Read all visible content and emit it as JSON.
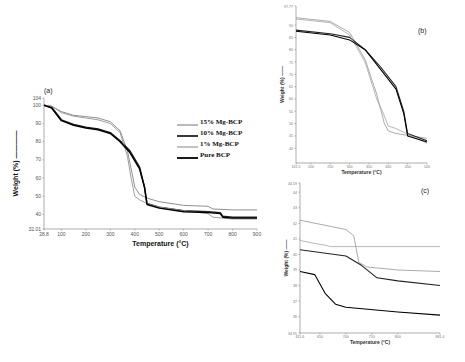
{
  "figure": {
    "panels": [
      "(a)",
      "(b)",
      "(c)"
    ]
  },
  "legend": {
    "items": [
      {
        "label": "15% Mg-BCP",
        "color": "#8a8a8a",
        "width": 1.2
      },
      {
        "label": "10% Mg-BCP",
        "color": "#222222",
        "width": 1.8
      },
      {
        "label": "1% Mg-BCP",
        "color": "#9a9a9a",
        "width": 1.2
      },
      {
        "label": "Pure BCP",
        "color": "#000000",
        "width": 1.8
      }
    ]
  },
  "chart_data": [
    {
      "type": "line",
      "panel": "(a)",
      "title": "",
      "xlabel": "Temperature (°C)",
      "ylabel": "Weight (%)",
      "xlim": [
        28.8,
        900
      ],
      "ylim": [
        32.01,
        104
      ],
      "xticks": [
        "28.8",
        "100",
        "200",
        "300",
        "400",
        "500",
        "600",
        "700",
        "800",
        "900"
      ],
      "yticks": [
        "32.01",
        "40",
        "50",
        "60",
        "70",
        "80",
        "90",
        "100",
        "104"
      ],
      "grid": false,
      "legend_position": "right-inside",
      "series": [
        {
          "name": "15% Mg-BCP",
          "x": [
            28.8,
            60,
            100,
            150,
            200,
            250,
            300,
            340,
            370,
            390,
            400,
            420,
            450,
            500,
            600,
            700,
            720,
            800,
            900
          ],
          "y": [
            100,
            99.5,
            96.5,
            94.5,
            93.8,
            93,
            91,
            86,
            75,
            62,
            55,
            51,
            49,
            47,
            45,
            44.5,
            43,
            42.5,
            42.5
          ]
        },
        {
          "name": "10% Mg-BCP",
          "x": [
            28.8,
            60,
            100,
            150,
            200,
            250,
            300,
            340,
            380,
            420,
            440,
            450,
            500,
            600,
            700,
            750,
            760,
            800,
            900
          ],
          "y": [
            100,
            99,
            92,
            89.5,
            88,
            87,
            85,
            80.5,
            75,
            66,
            55,
            46,
            44,
            42,
            41.5,
            41,
            39,
            38.5,
            38.5
          ]
        },
        {
          "name": "1% Mg-BCP",
          "x": [
            28.8,
            60,
            100,
            150,
            200,
            250,
            300,
            340,
            370,
            385,
            400,
            420,
            450,
            500,
            600,
            700,
            720,
            800,
            900
          ],
          "y": [
            100,
            99.5,
            96,
            94,
            93,
            92,
            90,
            85,
            72,
            60,
            50,
            48,
            46,
            44,
            42,
            40.5,
            38.5,
            37.5,
            37.5
          ]
        },
        {
          "name": "Pure BCP",
          "x": [
            28.8,
            60,
            100,
            150,
            200,
            250,
            300,
            340,
            380,
            420,
            440,
            450,
            500,
            600,
            700,
            750,
            760,
            800,
            900
          ],
          "y": [
            100,
            98.5,
            91.5,
            89,
            87.5,
            86.5,
            84.5,
            80,
            74,
            65,
            55,
            45.5,
            43.5,
            41.5,
            41,
            40.5,
            38.5,
            38,
            38
          ]
        }
      ]
    },
    {
      "type": "line",
      "panel": "(b)",
      "title": "",
      "xlabel": "Temperature (°C)",
      "ylabel": "Weight (%)",
      "xlim": [
        161.5,
        500
      ],
      "ylim": [
        34,
        97.77
      ],
      "xticks": [
        "161.5",
        "200",
        "250",
        "300",
        "350",
        "400",
        "450",
        "500"
      ],
      "yticks": [
        "97.77",
        "90",
        "85",
        "80",
        "75",
        "70",
        "65",
        "60",
        "55",
        "50",
        "45",
        "40"
      ],
      "grid": false,
      "series": [
        {
          "name": "15% Mg-BCP",
          "x": [
            161.5,
            250,
            300,
            340,
            370,
            390,
            400,
            420,
            500
          ],
          "y": [
            93,
            91.5,
            87,
            76,
            62,
            50,
            47,
            46,
            44
          ]
        },
        {
          "name": "10% Mg-BCP",
          "x": [
            161.5,
            250,
            300,
            340,
            380,
            420,
            440,
            450,
            500
          ],
          "y": [
            88,
            86.5,
            85,
            80,
            73,
            65,
            55,
            46,
            43
          ]
        },
        {
          "name": "1% Mg-BCP",
          "x": [
            161.5,
            250,
            300,
            340,
            370,
            385,
            400,
            420,
            500
          ],
          "y": [
            92.5,
            91,
            86,
            75,
            60,
            55,
            49,
            48,
            42
          ]
        },
        {
          "name": "Pure BCP",
          "x": [
            161.5,
            250,
            300,
            340,
            380,
            420,
            440,
            450,
            500
          ],
          "y": [
            87.5,
            86,
            84,
            80,
            72,
            64,
            54,
            45,
            42.5
          ]
        }
      ]
    },
    {
      "type": "line",
      "panel": "(c)",
      "title": "",
      "xlabel": "Temperature (°C)",
      "ylabel": "Weight (%)",
      "xlim": [
        611.6,
        881.4
      ],
      "ylim": [
        34.95,
        44.59
      ],
      "xticks": [
        "611.6",
        "650",
        "700",
        "750",
        "800",
        "881.4"
      ],
      "yticks": [
        "44.59",
        "44",
        "43",
        "42",
        "41",
        "40",
        "39",
        "38",
        "37",
        "36",
        "34.95"
      ],
      "grid": false,
      "series": [
        {
          "name": "15% Mg-BCP",
          "x": [
            611.6,
            700,
            715,
            725,
            740,
            800,
            881.4
          ],
          "y": [
            42.2,
            41.6,
            41.2,
            39.5,
            39.2,
            39.0,
            38.9
          ]
        },
        {
          "name": "10% Mg-BCP",
          "x": [
            611.6,
            700,
            730,
            760,
            800,
            881.4
          ],
          "y": [
            40.3,
            39.9,
            39.3,
            38.5,
            38.3,
            38.0
          ]
        },
        {
          "name": "1% Mg-BCP",
          "x": [
            611.6,
            640,
            660,
            670,
            700,
            800,
            881.4
          ],
          "y": [
            40.9,
            40.7,
            40.6,
            40.5,
            40.5,
            40.5,
            40.5
          ]
        },
        {
          "name": "Pure BCP",
          "x": [
            611.6,
            640,
            660,
            680,
            700,
            800,
            881.4
          ],
          "y": [
            38.9,
            38.7,
            37.5,
            36.8,
            36.6,
            36.3,
            36.1
          ]
        }
      ]
    }
  ]
}
